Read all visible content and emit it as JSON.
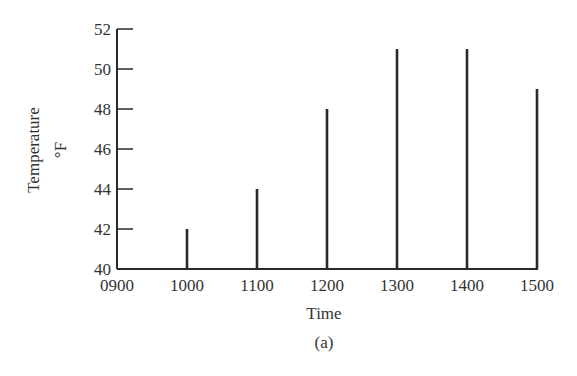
{
  "chart_data": {
    "type": "bar",
    "style": "stem/needle bars",
    "title": "",
    "caption": "(a)",
    "xlabel": "Time",
    "ylabel": "Temperature",
    "ylabel_unit": "°F",
    "categories": [
      "1000",
      "1100",
      "1200",
      "1300",
      "1400",
      "1500"
    ],
    "values": [
      42,
      44,
      48,
      51,
      51,
      49
    ],
    "x_tick_labels": [
      "0900",
      "1000",
      "1100",
      "1200",
      "1300",
      "1400",
      "1500"
    ],
    "y_tick_labels": [
      "40",
      "42",
      "44",
      "46",
      "48",
      "50",
      "52"
    ],
    "ylim": [
      40,
      52
    ],
    "y_tick_step": 2,
    "grid": false,
    "legend": null,
    "colors": {
      "bars": "#2a2a2a",
      "axis": "#2a2a2a",
      "text": "#333333",
      "background": "#ffffff"
    }
  },
  "labels": {
    "ylabel": "Temperature",
    "yunit": "°F",
    "xlabel": "Time",
    "caption": "(a)"
  }
}
